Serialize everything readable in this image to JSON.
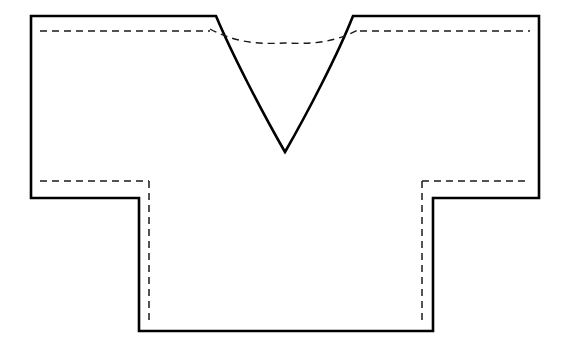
{
  "diagram": {
    "canvas": {
      "width": 572,
      "height": 350,
      "background": "#ffffff"
    },
    "colors": {
      "cut_line": "#000000",
      "seam_line": "#1a1a1a",
      "fill": "#ffffff"
    },
    "line_styles": {
      "cut_line_label": "solid cutting line",
      "cut_line_width": 2.6,
      "seam_line_label": "dashed seam / stitch line",
      "seam_line_width": 1.5,
      "seam_dash_pattern": "7 5"
    },
    "key_points": {
      "left_sleeve_outer_top": [
        31,
        16
      ],
      "left_shoulder_top": [
        31,
        16
      ],
      "neck_left_corner": [
        216,
        16
      ],
      "neck_point_bottom": [
        285,
        152
      ],
      "neck_right_corner": [
        353,
        16
      ],
      "right_shoulder_top": [
        539,
        16
      ],
      "right_sleeve_outer_bottom": [
        539,
        198
      ],
      "right_armhole_corner": [
        433,
        198
      ],
      "right_side_hem": [
        433,
        331
      ],
      "left_side_hem": [
        139,
        331
      ],
      "left_armhole_corner": [
        139,
        198
      ],
      "left_sleeve_outer_bottom": [
        31,
        198
      ]
    },
    "shapes": {
      "body_outline_path": "M 31 16 L 216 16 C 232 54 262 112 285 152 C 308 112 338 54 353 16 L 539 16 L 539 198 L 433 198 L 433 331 L 139 331 L 139 198 L 31 198 Z",
      "shoulder_seam_left_path": "M 40 31 L 210 31",
      "shoulder_seam_right_path": "M 360 31 L 530 31",
      "neckline_seam_path": "M 210 29 C 238 44 262 44 285 43 C 308 44 332 44 360 29",
      "sleeve_hem_left_path": "M 40 181 L 149 181",
      "sleeve_hem_right_path": "M 422 181 L 530 181",
      "side_seam_left_path": "M 149 181 L 149 322",
      "side_seam_right_path": "M 422 181 L 422 322"
    },
    "parts": [
      {
        "name": "left-sleeve",
        "label": "Left sleeve"
      },
      {
        "name": "right-sleeve",
        "label": "Right sleeve"
      },
      {
        "name": "body-panel",
        "label": "Body panel"
      },
      {
        "name": "v-neckline",
        "label": "V neckline"
      }
    ]
  }
}
